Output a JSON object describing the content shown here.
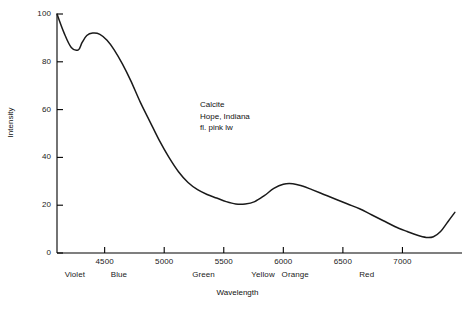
{
  "chart_data": {
    "type": "line",
    "title": "",
    "xlabel": "Wavelength",
    "ylabel": "Intensity",
    "xlim": [
      4100,
      7500
    ],
    "ylim": [
      0,
      100
    ],
    "grid": false,
    "legend": "none",
    "annotation_lines": [
      "Calcite",
      "Hope, Indiana",
      "fl. pink lw"
    ],
    "xticks": [
      4500,
      5000,
      5500,
      6000,
      6500,
      7000
    ],
    "xtick_labels": [
      "4500",
      "5000",
      "5500",
      "6000",
      "6500",
      "7000"
    ],
    "yticks": [
      0,
      20,
      40,
      60,
      80,
      100
    ],
    "ytick_labels": [
      "0",
      "20",
      "40",
      "60",
      "80",
      "100"
    ],
    "band_labels": [
      {
        "label": "Violet",
        "center": 4250
      },
      {
        "label": "Blue",
        "center": 4620
      },
      {
        "label": "Green",
        "center": 5330
      },
      {
        "label": "Yellow",
        "center": 5830
      },
      {
        "label": "Orange",
        "center": 6100
      },
      {
        "label": "Red",
        "center": 6700
      }
    ],
    "series": [
      {
        "name": "Calcite fluorescence spectrum",
        "x": [
          4100,
          4160,
          4220,
          4280,
          4310,
          4350,
          4400,
          4460,
          4520,
          4580,
          4650,
          4720,
          4800,
          4880,
          4960,
          5040,
          5120,
          5200,
          5280,
          5360,
          5440,
          5520,
          5600,
          5680,
          5760,
          5840,
          5920,
          6000,
          6080,
          6160,
          6240,
          6340,
          6440,
          6540,
          6640,
          6740,
          6840,
          6940,
          7040,
          7120,
          7200,
          7260,
          7320,
          7380,
          7440
        ],
        "y": [
          100,
          92,
          86,
          85,
          88,
          91,
          92,
          91.5,
          89,
          85,
          79,
          72,
          63,
          55,
          47,
          40,
          34,
          29.5,
          26.5,
          24.5,
          23,
          21.5,
          20.5,
          20.5,
          21.5,
          24,
          27,
          28.8,
          29,
          28,
          26.5,
          24.5,
          22.5,
          20.5,
          18.5,
          16,
          13.5,
          11,
          9,
          7.5,
          6.5,
          6.8,
          9,
          13,
          17
        ]
      }
    ]
  },
  "plot": {
    "axis_color": "#000000",
    "curve_color": "#1a1a1a",
    "background": "#ffffff"
  }
}
